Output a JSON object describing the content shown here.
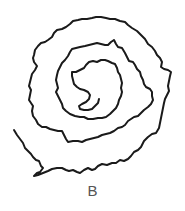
{
  "figure": {
    "label": "B",
    "stroke_color": "#1a1a1a",
    "background": "#ffffff"
  }
}
